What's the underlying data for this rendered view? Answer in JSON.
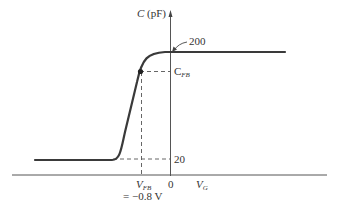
{
  "figure": {
    "y_axis_label_var": "C",
    "y_axis_label_unit": "(pF)",
    "x_axis_label_var": "V",
    "x_axis_label_sub": "G",
    "annotation_200": "200",
    "label_cfb_var": "C",
    "label_cfb_sub": "FB",
    "tick_20": "20",
    "tick_0": "0",
    "label_vfb_var": "V",
    "label_vfb_sub": "FB",
    "label_vfb_value": "= −0.8 V"
  },
  "colors": {
    "curve": "#3a3a3a",
    "axes": "#555555",
    "dashed": "#555555",
    "text": "#333333"
  }
}
